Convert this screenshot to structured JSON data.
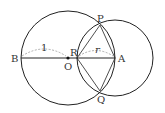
{
  "diagram": {
    "type": "geometry",
    "points": {
      "B": {
        "label": "B",
        "x": 21,
        "y": 58
      },
      "O": {
        "label": "O",
        "x": 68,
        "y": 58
      },
      "R": {
        "label": "R",
        "x": 77,
        "y": 58
      },
      "A": {
        "label": "A",
        "x": 115,
        "y": 58
      },
      "P": {
        "label": "P",
        "x": 100,
        "y": 25
      },
      "Q": {
        "label": "Q",
        "x": 100,
        "y": 91
      }
    },
    "circles": [
      {
        "name": "circle-O",
        "center": "O",
        "radius": 47
      },
      {
        "name": "circle-A",
        "center": "A",
        "radius": 38
      }
    ],
    "dimension_labels": {
      "OB": "1",
      "RA": "r"
    },
    "colors": {
      "stroke": "#222222",
      "dashed": "#999999",
      "background": "#ffffff"
    }
  }
}
